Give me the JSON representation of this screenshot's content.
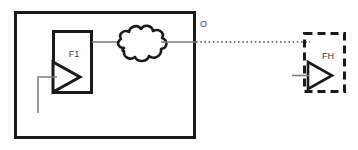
{
  "diagram": {
    "type": "block-diagram",
    "canvas": {
      "width": 358,
      "height": 150,
      "background": "#ffffff"
    },
    "colors": {
      "stroke_heavy": "#1a1a1a",
      "stroke_light": "#7f7f7f",
      "text": "#3a3a3a",
      "background": "#ffffff"
    },
    "outer_enclosure": {
      "label": "",
      "style": "solid",
      "x": 14,
      "y": 11,
      "width": 181,
      "height": 127,
      "stroke_width": 3
    },
    "blocks": [
      {
        "id": "f1",
        "label": "F1",
        "style": "solid",
        "x": 52,
        "y": 30,
        "width": 40,
        "height": 63,
        "stroke_width": 3,
        "label_x": 74,
        "label_y": 55,
        "symbol": "amplifier-triangle"
      },
      {
        "id": "fh",
        "label": "FH",
        "style": "dashed",
        "x": 303,
        "y": 32,
        "width": 42,
        "height": 61,
        "stroke_width": 3,
        "label_x": 328,
        "label_y": 57,
        "symbol": "amplifier-triangle"
      }
    ],
    "cloud": {
      "id": "network-cloud",
      "label": "",
      "center_x": 141,
      "center_y": 43
    },
    "port_labels": [
      {
        "id": "o-port",
        "text": "O",
        "x": 200,
        "y": 25
      }
    ],
    "connections": [
      {
        "id": "f1-to-cloud",
        "style": "solid-thin",
        "from_x": 92,
        "from_y": 42,
        "to_x": 120,
        "to_y": 42
      },
      {
        "id": "cloud-to-edge",
        "style": "solid-thin",
        "from_x": 162,
        "from_y": 42,
        "to_x": 196,
        "to_y": 42
      },
      {
        "id": "o-to-fh",
        "style": "dotted",
        "from_x": 196,
        "from_y": 42,
        "to_x": 310,
        "to_y": 42
      },
      {
        "id": "f1-input-feed",
        "style": "solid-thin",
        "points": "57,77 38,77 38,112"
      },
      {
        "id": "fh-input-feed",
        "style": "solid-thin",
        "from_x": 293,
        "from_y": 75,
        "to_x": 309,
        "to_y": 75
      }
    ]
  }
}
